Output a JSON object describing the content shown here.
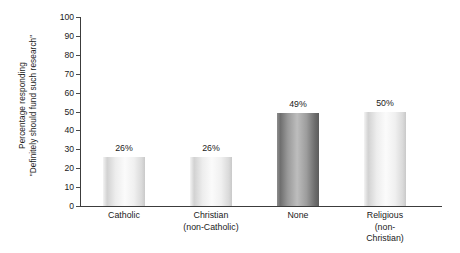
{
  "chart_data": {
    "type": "bar",
    "title": "",
    "subtitle": "",
    "xlabel": "",
    "ylabel_line1": "Percentage responding",
    "ylabel_line2": "\"Definitely should fund such research\"",
    "categories": [
      "Catholic",
      "Christian (non-Catholic)",
      "None",
      "Religious (non-Christian)"
    ],
    "category_lines": [
      {
        "line1": "Catholic",
        "line2": ""
      },
      {
        "line1": "Christian",
        "line2": "(non-Catholic)"
      },
      {
        "line1": "None",
        "line2": ""
      },
      {
        "line1": "Religious",
        "line2": "(non-Christian)"
      }
    ],
    "values": [
      26,
      26,
      49,
      50
    ],
    "value_labels": [
      "26%",
      "26%",
      "49%",
      "50%"
    ],
    "bar_styles": [
      "light",
      "light",
      "dark",
      "light"
    ],
    "ylim": [
      0,
      100
    ],
    "ytick_values": [
      0,
      10,
      20,
      30,
      40,
      50,
      60,
      70,
      80,
      90,
      100
    ],
    "ytick_labels": [
      "0",
      "10",
      "20",
      "30",
      "40",
      "50",
      "60",
      "70",
      "80",
      "90",
      "100"
    ],
    "grid": false,
    "legend": false,
    "legend_position": "none",
    "axis_color": "#3c3c3c",
    "text_color": "#1a1a1a",
    "background": "#ffffff"
  },
  "layout": {
    "bar_lefts_pct": [
      6.1,
      30.2,
      54.3,
      78.4
    ],
    "bar_width_pct": 11.6,
    "label_centers_pct": [
      11.9,
      36.0,
      60.1,
      84.2
    ]
  }
}
